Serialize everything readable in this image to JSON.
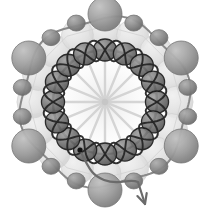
{
  "figure": {
    "canvas": {
      "width": 212,
      "height": 213,
      "background": "#ffffff"
    },
    "center": {
      "x": 105,
      "y": 102
    },
    "colors": {
      "background": "#ffffff",
      "pale_fill": "#e3e3e3",
      "pale_stroke": "#cfcfcf",
      "mid_gray": "#9b9b9b",
      "mid_gray_dark": "#7e7e7e",
      "dark_gray": "#6a6a6a",
      "near_black": "#2b2b2b",
      "black": "#141414",
      "spoke": "#cccccc",
      "highlight": "#d8d8d8"
    },
    "hub": {
      "name": "radial-spoke-hub",
      "spoke_count": 16,
      "inner_radius": 3,
      "outer_radius": 62,
      "color": "#cfcfcf"
    },
    "pale_layer": {
      "name": "pale-background-beads",
      "ring_radius": 72,
      "bead_count": 16,
      "bead_radius": 16,
      "fill": "#e3e3e3",
      "stroke": "#d2d2d2"
    },
    "outer_ring": {
      "name": "outer-bead-ring",
      "ring_radius": 84,
      "path_color": "#8a8a8a",
      "path_width": 2.0,
      "large_bead_radius": 17,
      "small_bead_radius": 8,
      "large_bead_fill": "#9b9b9b",
      "small_bead_fill": "#888888",
      "bead_count": 18,
      "large_bead_count": 6
    },
    "inner_ring": {
      "name": "inner-bead-ring",
      "ring_radius": 52,
      "path_color": "#262626",
      "path_width": 2.4,
      "bead_radius": 11,
      "bead_fill": "#6f6f6f",
      "bead_stroke": "#1c1c1c",
      "bead_count": 16,
      "helix_turns": 8
    },
    "chain_tail": {
      "name": "chain-tail-arrow",
      "start_dot": {
        "x": 80,
        "y": 150,
        "radius": 2.6,
        "color": "#111111"
      },
      "arrow_tip": {
        "x": 145,
        "y": 204
      },
      "arrow_color": "#6b6b6b",
      "stroke_width": 2.2
    },
    "annotations": {
      "start_label": "",
      "direction_label": ""
    }
  }
}
